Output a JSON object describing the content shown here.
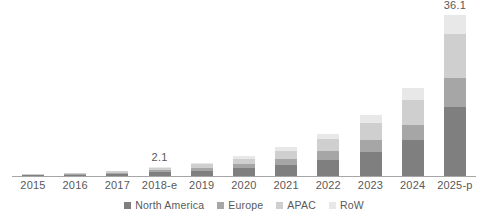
{
  "chart_data": {
    "type": "bar",
    "stacked": true,
    "title": "",
    "subtitle": "",
    "xlabel": "",
    "ylabel": "",
    "grid": false,
    "axis": {
      "y_visible": false,
      "x_axis_line": true
    },
    "ylim": [
      0,
      38
    ],
    "legend_position": "bottom-center",
    "categories": [
      "2015",
      "2016",
      "2017",
      "2018-e",
      "2019",
      "2020",
      "2021",
      "2022",
      "2023",
      "2024",
      "2025-p"
    ],
    "series": [
      {
        "name": "North America",
        "color": "#7f7f7f",
        "values": [
          0.2,
          0.3,
          0.5,
          0.9,
          1.2,
          1.7,
          2.4,
          3.6,
          5.4,
          8.0,
          15.5
        ]
      },
      {
        "name": "Europe",
        "color": "#a6a6a6",
        "values": [
          0.1,
          0.15,
          0.25,
          0.4,
          0.6,
          0.9,
          1.3,
          1.9,
          2.6,
          3.5,
          6.4
        ]
      },
      {
        "name": "APAC",
        "color": "#cfcfcf",
        "values": [
          0.1,
          0.15,
          0.3,
          0.5,
          0.8,
          1.2,
          1.8,
          2.7,
          3.9,
          5.6,
          9.9
        ]
      },
      {
        "name": "RoW",
        "color": "#e8e8e8",
        "values": [
          0.05,
          0.1,
          0.15,
          0.3,
          0.4,
          0.6,
          0.9,
          1.3,
          1.8,
          2.5,
          4.3
        ]
      }
    ],
    "totals": [
      0.45,
      0.7,
      1.2,
      2.1,
      3.0,
      4.4,
      6.4,
      9.5,
      13.7,
      19.6,
      36.1
    ],
    "data_labels": [
      {
        "category": "2018-e",
        "value": "2.1"
      },
      {
        "category": "2025-p",
        "value": "36.1"
      }
    ],
    "annotations": []
  },
  "legend": {
    "items": [
      {
        "label": "North America",
        "swatch_name": "legend-swatch-north-america",
        "color": "#7f7f7f"
      },
      {
        "label": "Europe",
        "swatch_name": "legend-swatch-europe",
        "color": "#a6a6a6"
      },
      {
        "label": "APAC",
        "swatch_name": "legend-swatch-apac",
        "color": "#cfcfcf"
      },
      {
        "label": "RoW",
        "swatch_name": "legend-swatch-row",
        "color": "#e8e8e8"
      }
    ]
  },
  "colors": {
    "background": "#ffffff",
    "text": "#595959",
    "axis_line": "#a6a6a6",
    "north_america": "#7f7f7f",
    "europe": "#a6a6a6",
    "apac": "#cfcfcf",
    "row": "#e8e8e8"
  }
}
